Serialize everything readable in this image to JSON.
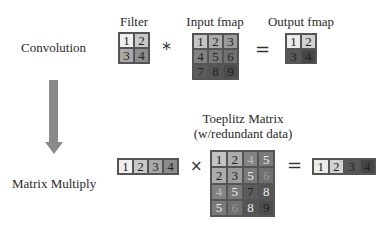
{
  "labels": {
    "convolution": "Convolution",
    "matrix_multiply": "Matrix Multiply",
    "filter": "Filter",
    "input_fmap": "Input fmap",
    "output_fmap": "Output fmap",
    "toeplitz_line1": "Toeplitz Matrix",
    "toeplitz_line2": "(w/redundant data)"
  },
  "operators": {
    "conv": "*",
    "equals_top": "=",
    "times": "×",
    "equals_bottom": "="
  },
  "filter": {
    "cells": [
      {
        "v": "1",
        "bg": "#f0f0f0",
        "fg": "#222"
      },
      {
        "v": "2",
        "bg": "#c8c8c8",
        "fg": "#222"
      },
      {
        "v": "3",
        "bg": "#a9a9a9",
        "fg": "#222"
      },
      {
        "v": "4",
        "bg": "#8c8c8c",
        "fg": "#222"
      }
    ]
  },
  "input_fmap": {
    "cells": [
      {
        "v": "1",
        "bg": "#c4c4c4",
        "fg": "#222"
      },
      {
        "v": "2",
        "bg": "#acacac",
        "fg": "#222"
      },
      {
        "v": "3",
        "bg": "#9c9c9c",
        "fg": "#222"
      },
      {
        "v": "4",
        "bg": "#828282",
        "fg": "#222"
      },
      {
        "v": "5",
        "bg": "#7a7a7a",
        "fg": "#222"
      },
      {
        "v": "6",
        "bg": "#707070",
        "fg": "#222"
      },
      {
        "v": "7",
        "bg": "#5c5c5c",
        "fg": "#222"
      },
      {
        "v": "8",
        "bg": "#555555",
        "fg": "#222"
      },
      {
        "v": "9",
        "bg": "#4c4c4c",
        "fg": "#222"
      }
    ]
  },
  "output_fmap": {
    "cells": [
      {
        "v": "1",
        "bg": "#ebebeb",
        "fg": "#222"
      },
      {
        "v": "2",
        "bg": "#d2d2d2",
        "fg": "#222"
      },
      {
        "v": "3",
        "bg": "#575757",
        "fg": "#222"
      },
      {
        "v": "4",
        "bg": "#464646",
        "fg": "#222"
      }
    ]
  },
  "filter_vector": {
    "cells": [
      {
        "v": "1",
        "bg": "#f0f0f0",
        "fg": "#222"
      },
      {
        "v": "2",
        "bg": "#c8c8c8",
        "fg": "#222"
      },
      {
        "v": "3",
        "bg": "#a9a9a9",
        "fg": "#222"
      },
      {
        "v": "4",
        "bg": "#8c8c8c",
        "fg": "#222"
      }
    ]
  },
  "toeplitz": {
    "cells": [
      {
        "v": "1",
        "bg": "#c4c4c4",
        "fg": "#222"
      },
      {
        "v": "2",
        "bg": "#acacac",
        "fg": "#222"
      },
      {
        "v": "4",
        "bg": "#828282",
        "fg": "#bdbdbd"
      },
      {
        "v": "5",
        "bg": "#7a7a7a",
        "fg": "#eeeeee"
      },
      {
        "v": "2",
        "bg": "#acacac",
        "fg": "#222"
      },
      {
        "v": "3",
        "bg": "#9c9c9c",
        "fg": "#222"
      },
      {
        "v": "5",
        "bg": "#7a7a7a",
        "fg": "#eeeeee"
      },
      {
        "v": "6",
        "bg": "#707070",
        "fg": "#9a9a9a"
      },
      {
        "v": "4",
        "bg": "#828282",
        "fg": "#bdbdbd"
      },
      {
        "v": "5",
        "bg": "#7a7a7a",
        "fg": "#eeeeee"
      },
      {
        "v": "7",
        "bg": "#5c5c5c",
        "fg": "#222"
      },
      {
        "v": "8",
        "bg": "#555555",
        "fg": "#eeeeee"
      },
      {
        "v": "5",
        "bg": "#7a7a7a",
        "fg": "#eeeeee"
      },
      {
        "v": "6",
        "bg": "#707070",
        "fg": "#9a9a9a"
      },
      {
        "v": "8",
        "bg": "#555555",
        "fg": "#eeeeee"
      },
      {
        "v": "9",
        "bg": "#4c4c4c",
        "fg": "#222"
      }
    ]
  },
  "result_vector": {
    "cells": [
      {
        "v": "1",
        "bg": "#ebebeb",
        "fg": "#222"
      },
      {
        "v": "2",
        "bg": "#d2d2d2",
        "fg": "#222"
      },
      {
        "v": "3",
        "bg": "#575757",
        "fg": "#222"
      },
      {
        "v": "4",
        "bg": "#464646",
        "fg": "#222"
      }
    ]
  },
  "colors": {
    "arrow": "#8a8a8a",
    "grid_border": "#555555"
  }
}
